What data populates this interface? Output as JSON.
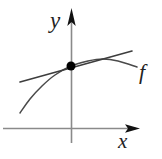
{
  "figure": {
    "background_color": "#ffffff",
    "width": 162,
    "height": 159,
    "axis_color": "#8a8a8a",
    "curve_color": "#4a4a4a",
    "tangent_color": "#3d3d3d",
    "point_color": "#000000",
    "label_color": "#222222"
  },
  "labels": {
    "y_axis": "y",
    "x_axis": "x",
    "function": "f"
  },
  "chart_data": {
    "type": "line",
    "title": "",
    "subtitle": "",
    "xlabel": "x",
    "ylabel": "y",
    "grid": false,
    "legend": false,
    "annotations": [
      {
        "name": "function-label",
        "text": "f",
        "x": 146,
        "y": 72,
        "style": "italic"
      },
      {
        "name": "tangency-point",
        "text": "",
        "x": 71,
        "y": 66,
        "style": "filled-dot"
      }
    ],
    "axes": {
      "origin": {
        "x": 71,
        "y": 128
      },
      "x_axis": {
        "from": [
          3,
          128
        ],
        "to": [
          140,
          128
        ],
        "arrow": "right"
      },
      "y_axis": {
        "from": [
          71,
          143
        ],
        "to": [
          71,
          8
        ],
        "arrow": "up"
      }
    },
    "series": [
      {
        "name": "f",
        "role": "curve",
        "shape": "concave-down",
        "points": [
          [
            20,
            113
          ],
          [
            30,
            99
          ],
          [
            42,
            86
          ],
          [
            55,
            75
          ],
          [
            71,
            66
          ],
          [
            88,
            61
          ],
          [
            103,
            59
          ],
          [
            118,
            61
          ],
          [
            137,
            67
          ]
        ]
      },
      {
        "name": "tangent",
        "role": "tangent-line",
        "shape": "straight",
        "points": [
          [
            20,
            82
          ],
          [
            71,
            66
          ],
          [
            132,
            51
          ]
        ]
      }
    ],
    "points": [
      {
        "name": "point-of-tangency",
        "x": 71,
        "y": 66,
        "radius": 4.5,
        "filled": true
      }
    ]
  }
}
